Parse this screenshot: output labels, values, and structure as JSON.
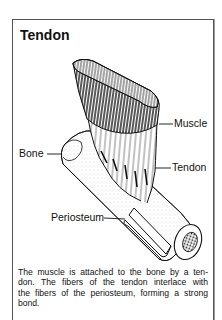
{
  "figure": {
    "title": "Tendon",
    "labels": {
      "muscle": "Muscle",
      "bone": "Bone",
      "tendon": "Tendon",
      "periosteum": "Periosteum"
    },
    "caption_lines": [
      "The muscle is attached to the bone by a ten-",
      "don. The fibers of the tendon interlace with",
      "the fibers of the periosteum, forming a strong",
      "bond."
    ],
    "colors": {
      "ink": "#111111",
      "border": "#555555",
      "background": "#ffffff"
    }
  }
}
